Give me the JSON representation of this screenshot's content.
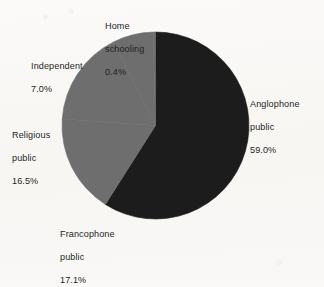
{
  "chart_data": {
    "type": "pie",
    "title": "",
    "subtitle": "",
    "xlabel": "",
    "ylabel": "",
    "legend_position": "none",
    "grid": false,
    "units": "percent",
    "start_angle_deg": 0,
    "direction": "clockwise",
    "categories": [
      "Anglophone public",
      "Francophone public",
      "Religious public",
      "Independent",
      "Home schooling"
    ],
    "values": [
      59.0,
      17.1,
      16.5,
      7.0,
      0.4
    ],
    "labels": [
      "59.0%",
      "17.1%",
      "16.5%",
      "7.0%",
      "0.4%"
    ],
    "colors": [
      "#1c1c1c",
      "#6e6e6e",
      "#6e6e6e",
      "#6e6e6e",
      "#6e6e6e"
    ],
    "slices": [
      {
        "name_line1": "Anglophone",
        "name_line2": "public",
        "percent": "59.0%",
        "value": 59.0,
        "color": "#1c1c1c"
      },
      {
        "name_line1": "Francophone",
        "name_line2": "public",
        "percent": "17.1%",
        "value": 17.1,
        "color": "#6e6e6e"
      },
      {
        "name_line1": "Religious",
        "name_line2": "public",
        "percent": "16.5%",
        "value": 16.5,
        "color": "#6e6e6e"
      },
      {
        "name_line1": "Independent",
        "name_line2": "",
        "percent": "7.0%",
        "value": 7.0,
        "color": "#6e6e6e"
      },
      {
        "name_line1": "Home",
        "name_line2": "schooling",
        "percent": "0.4%",
        "value": 0.4,
        "color": "#6e6e6e"
      }
    ]
  },
  "colors": {
    "background": "#faf9f7",
    "dark_slice": "#1c1c1c",
    "gray_slice": "#6e6e6e",
    "text": "#1f1f1f"
  }
}
